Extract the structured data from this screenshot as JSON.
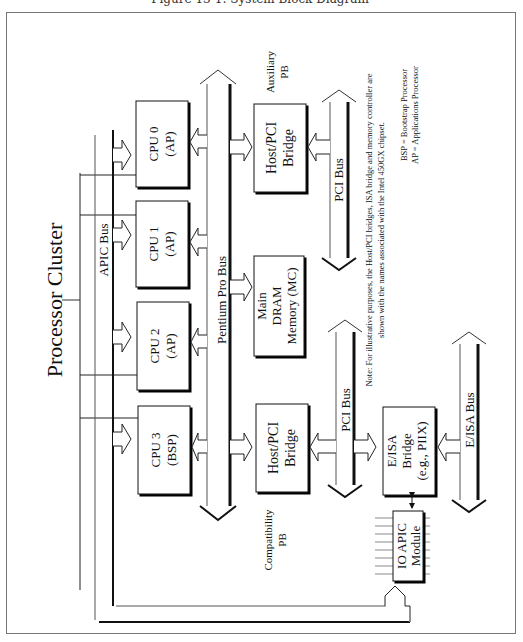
{
  "caption": "Figure 13-1: System Block Diagram",
  "diagram": {
    "title": "Processor Cluster",
    "buses": {
      "apic": "APIC Bus",
      "pentium_pro": "Pentium Pro Bus",
      "pci_top": "PCI Bus",
      "pci_bottom": "PCI Bus",
      "eisa": "E/ISA Bus"
    },
    "cpus": [
      {
        "name": "CPU 0",
        "role": "(AP)"
      },
      {
        "name": "CPU 1",
        "role": "(AP)"
      },
      {
        "name": "CPU 2",
        "role": "(AP)"
      },
      {
        "name": "CPU 3",
        "role": "(BSP)"
      }
    ],
    "bridges": {
      "aux": {
        "line1": "Host/PCI",
        "line2": "Bridge",
        "label1": "Auxiliary",
        "label2": "PB"
      },
      "compat": {
        "line1": "Host/PCI",
        "line2": "Bridge",
        "label1": "Compatibility",
        "label2": "PB"
      },
      "eisa": {
        "line1": "E/ISA",
        "line2": "Bridge",
        "line3": "(e.g., PIIX)"
      }
    },
    "memory": {
      "line1": "Main",
      "line2": "DRAM",
      "line3": "Memory (MC)"
    },
    "ioapic": {
      "line1": "IO APIC",
      "line2": "Module"
    },
    "note": {
      "line1": "Note: For illustrative purposes, the Host/PCI bridges, ISA bridge and memory controller are",
      "line2": "shown with the names associated with the Intel 450GX chipset."
    },
    "legend": {
      "bsp": "BSP = Bootstrap Processor",
      "ap": "AP = Applications Processor"
    }
  }
}
